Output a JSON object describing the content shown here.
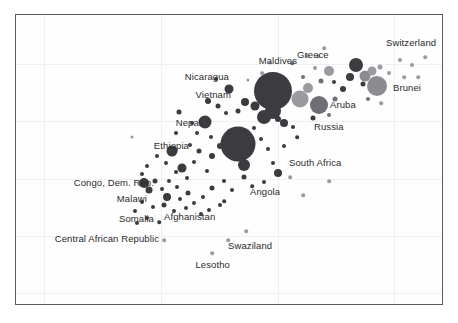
{
  "chart_data": {
    "type": "scatter",
    "title": "",
    "subtitle": "",
    "xlabel": "",
    "ylabel": "",
    "xlim": [
      0,
      428
    ],
    "ylim": [
      0,
      291
    ],
    "grid": true,
    "legend": "none",
    "note": "Bubble scatter of countries; bubble area encodes a third magnitude variable, shade encodes a fourth. Positions read in plot-pixel coordinates from the rendered figure.",
    "gridlines_x": [
      28,
      145,
      262,
      378
    ],
    "gridlines_y": [
      49,
      106,
      164,
      221,
      278
    ],
    "colors": {
      "bubble_dark": "#3c3c40",
      "bubble_mid": "#6e6e74",
      "bubble_light": "#9a9aa0",
      "bubble_grayish": "#8b8b90",
      "frame": "#5a5a60",
      "grid": "#f0f0f2",
      "label_text": "#2b2b2b",
      "background": "#ffffff"
    },
    "labels": [
      {
        "text": "Switzerland",
        "x": 370,
        "y": 28,
        "anchor": "left"
      },
      {
        "text": "Greece",
        "x": 281,
        "y": 40,
        "anchor": "left"
      },
      {
        "text": "Maldives",
        "x": 281,
        "y": 46,
        "anchor": "right"
      },
      {
        "text": "Brunei",
        "x": 377,
        "y": 73,
        "anchor": "left"
      },
      {
        "text": "Aruba",
        "x": 314,
        "y": 90,
        "anchor": "left"
      },
      {
        "text": "Nicaragua",
        "x": 213,
        "y": 62,
        "anchor": "right"
      },
      {
        "text": "Vietnam",
        "x": 215,
        "y": 80,
        "anchor": "right"
      },
      {
        "text": "Russia",
        "x": 298,
        "y": 112,
        "anchor": "left"
      },
      {
        "text": "Nepal",
        "x": 185,
        "y": 108,
        "anchor": "right"
      },
      {
        "text": "Ethiopia",
        "x": 173,
        "y": 131,
        "anchor": "right"
      },
      {
        "text": "South Africa",
        "x": 273,
        "y": 148,
        "anchor": "left"
      },
      {
        "text": "Congo, Dem. Rep.",
        "x": 138,
        "y": 168,
        "anchor": "right"
      },
      {
        "text": "Angola",
        "x": 234,
        "y": 177,
        "anchor": "left"
      },
      {
        "text": "Malawi",
        "x": 131,
        "y": 184,
        "anchor": "right"
      },
      {
        "text": "Afghanistan",
        "x": 148,
        "y": 202,
        "anchor": "left"
      },
      {
        "text": "Somalia",
        "x": 138,
        "y": 204,
        "anchor": "right"
      },
      {
        "text": "Central African Republic",
        "x": 143,
        "y": 224,
        "anchor": "right"
      },
      {
        "text": "Swaziland",
        "x": 212,
        "y": 231,
        "anchor": "left"
      },
      {
        "text": "Lesotho",
        "x": 214,
        "y": 250,
        "anchor": "right"
      }
    ],
    "bubbles": [
      {
        "x": 257,
        "y": 76,
        "r": 19.0,
        "shade": "dark"
      },
      {
        "x": 222,
        "y": 129,
        "r": 17.5,
        "shade": "dark"
      },
      {
        "x": 228,
        "y": 150,
        "r": 6.0,
        "shade": "dark"
      },
      {
        "x": 284,
        "y": 84,
        "r": 8.5,
        "shade": "light"
      },
      {
        "x": 292,
        "y": 73,
        "r": 5.0,
        "shade": "light"
      },
      {
        "x": 361,
        "y": 71,
        "r": 10.0,
        "shade": "grayish"
      },
      {
        "x": 340,
        "y": 50,
        "r": 7.0,
        "shade": "dark"
      },
      {
        "x": 349,
        "y": 61,
        "r": 5.5,
        "shade": "grayish"
      },
      {
        "x": 356,
        "y": 56,
        "r": 4.5,
        "shade": "light"
      },
      {
        "x": 334,
        "y": 62,
        "r": 4.0,
        "shade": "dark"
      },
      {
        "x": 327,
        "y": 74,
        "r": 3.0,
        "shade": "dark"
      },
      {
        "x": 318,
        "y": 67,
        "r": 2.0,
        "shade": "dark"
      },
      {
        "x": 347,
        "y": 69,
        "r": 2.5,
        "shade": "dark"
      },
      {
        "x": 364,
        "y": 52,
        "r": 2.5,
        "shade": "light"
      },
      {
        "x": 373,
        "y": 58,
        "r": 2.0,
        "shade": "light"
      },
      {
        "x": 313,
        "y": 56,
        "r": 5.0,
        "shade": "light"
      },
      {
        "x": 305,
        "y": 66,
        "r": 2.5,
        "shade": "mid"
      },
      {
        "x": 299,
        "y": 53,
        "r": 2.0,
        "shade": "light"
      },
      {
        "x": 291,
        "y": 41,
        "r": 2.0,
        "shade": "light"
      },
      {
        "x": 302,
        "y": 41,
        "r": 1.8,
        "shade": "light"
      },
      {
        "x": 308,
        "y": 33,
        "r": 1.8,
        "shade": "light"
      },
      {
        "x": 384,
        "y": 45,
        "r": 2.0,
        "shade": "light"
      },
      {
        "x": 396,
        "y": 50,
        "r": 2.0,
        "shade": "light"
      },
      {
        "x": 409,
        "y": 42,
        "r": 1.8,
        "shade": "light"
      },
      {
        "x": 388,
        "y": 62,
        "r": 1.8,
        "shade": "light"
      },
      {
        "x": 402,
        "y": 62,
        "r": 1.8,
        "shade": "light"
      },
      {
        "x": 352,
        "y": 84,
        "r": 2.0,
        "shade": "mid"
      },
      {
        "x": 365,
        "y": 88,
        "r": 1.8,
        "shade": "light"
      },
      {
        "x": 303,
        "y": 90,
        "r": 9.0,
        "shade": "mid"
      },
      {
        "x": 297,
        "y": 103,
        "r": 2.5,
        "shade": "dark"
      },
      {
        "x": 313,
        "y": 100,
        "r": 2.0,
        "shade": "mid"
      },
      {
        "x": 319,
        "y": 84,
        "r": 2.5,
        "shade": "mid"
      },
      {
        "x": 287,
        "y": 62,
        "r": 2.0,
        "shade": "mid"
      },
      {
        "x": 276,
        "y": 48,
        "r": 1.8,
        "shade": "mid"
      },
      {
        "x": 268,
        "y": 108,
        "r": 4.0,
        "shade": "dark"
      },
      {
        "x": 277,
        "y": 112,
        "r": 2.0,
        "shade": "dark"
      },
      {
        "x": 257,
        "y": 96,
        "r": 8.0,
        "shade": "dark"
      },
      {
        "x": 248,
        "y": 102,
        "r": 7.0,
        "shade": "dark"
      },
      {
        "x": 262,
        "y": 104,
        "r": 3.0,
        "shade": "dark"
      },
      {
        "x": 239,
        "y": 91,
        "r": 4.5,
        "shade": "dark"
      },
      {
        "x": 229,
        "y": 87,
        "r": 4.0,
        "shade": "dark"
      },
      {
        "x": 222,
        "y": 96,
        "r": 2.5,
        "shade": "dark"
      },
      {
        "x": 238,
        "y": 113,
        "r": 2.0,
        "shade": "dark"
      },
      {
        "x": 245,
        "y": 124,
        "r": 2.0,
        "shade": "dark"
      },
      {
        "x": 252,
        "y": 134,
        "r": 2.0,
        "shade": "dark"
      },
      {
        "x": 257,
        "y": 148,
        "r": 2.0,
        "shade": "dark"
      },
      {
        "x": 268,
        "y": 131,
        "r": 2.0,
        "shade": "dark"
      },
      {
        "x": 281,
        "y": 122,
        "r": 1.8,
        "shade": "dark"
      },
      {
        "x": 213,
        "y": 74,
        "r": 4.5,
        "shade": "dark"
      },
      {
        "x": 200,
        "y": 64,
        "r": 2.0,
        "shade": "dark"
      },
      {
        "x": 192,
        "y": 86,
        "r": 3.0,
        "shade": "dark"
      },
      {
        "x": 202,
        "y": 91,
        "r": 2.5,
        "shade": "dark"
      },
      {
        "x": 210,
        "y": 98,
        "r": 2.0,
        "shade": "dark"
      },
      {
        "x": 189,
        "y": 107,
        "r": 6.5,
        "shade": "dark"
      },
      {
        "x": 176,
        "y": 108,
        "r": 2.0,
        "shade": "dark"
      },
      {
        "x": 163,
        "y": 97,
        "r": 2.5,
        "shade": "dark"
      },
      {
        "x": 181,
        "y": 118,
        "r": 2.0,
        "shade": "dark"
      },
      {
        "x": 195,
        "y": 122,
        "r": 2.0,
        "shade": "dark"
      },
      {
        "x": 204,
        "y": 131,
        "r": 3.0,
        "shade": "dark"
      },
      {
        "x": 196,
        "y": 141,
        "r": 3.0,
        "shade": "dark"
      },
      {
        "x": 183,
        "y": 136,
        "r": 2.5,
        "shade": "dark"
      },
      {
        "x": 174,
        "y": 130,
        "r": 2.0,
        "shade": "dark"
      },
      {
        "x": 160,
        "y": 118,
        "r": 2.0,
        "shade": "dark"
      },
      {
        "x": 156,
        "y": 136,
        "r": 5.5,
        "shade": "dark"
      },
      {
        "x": 166,
        "y": 153,
        "r": 4.5,
        "shade": "dark"
      },
      {
        "x": 178,
        "y": 147,
        "r": 2.0,
        "shade": "dark"
      },
      {
        "x": 191,
        "y": 156,
        "r": 2.0,
        "shade": "dark"
      },
      {
        "x": 171,
        "y": 163,
        "r": 2.0,
        "shade": "dark"
      },
      {
        "x": 160,
        "y": 157,
        "r": 2.0,
        "shade": "dark"
      },
      {
        "x": 150,
        "y": 148,
        "r": 2.0,
        "shade": "dark"
      },
      {
        "x": 141,
        "y": 141,
        "r": 2.0,
        "shade": "dark"
      },
      {
        "x": 131,
        "y": 151,
        "r": 2.0,
        "shade": "dark"
      },
      {
        "x": 126,
        "y": 159,
        "r": 2.0,
        "shade": "dark"
      },
      {
        "x": 139,
        "y": 166,
        "r": 2.5,
        "shade": "dark"
      },
      {
        "x": 128,
        "y": 168,
        "r": 5.0,
        "shade": "dark"
      },
      {
        "x": 133,
        "y": 175,
        "r": 3.5,
        "shade": "dark"
      },
      {
        "x": 146,
        "y": 174,
        "r": 2.0,
        "shade": "dark"
      },
      {
        "x": 153,
        "y": 166,
        "r": 2.0,
        "shade": "dark"
      },
      {
        "x": 161,
        "y": 172,
        "r": 2.0,
        "shade": "dark"
      },
      {
        "x": 151,
        "y": 182,
        "r": 4.0,
        "shade": "dark"
      },
      {
        "x": 164,
        "y": 184,
        "r": 2.0,
        "shade": "dark"
      },
      {
        "x": 172,
        "y": 178,
        "r": 2.5,
        "shade": "dark"
      },
      {
        "x": 178,
        "y": 188,
        "r": 2.0,
        "shade": "dark"
      },
      {
        "x": 187,
        "y": 182,
        "r": 2.0,
        "shade": "dark"
      },
      {
        "x": 196,
        "y": 173,
        "r": 2.5,
        "shade": "dark"
      },
      {
        "x": 208,
        "y": 166,
        "r": 2.0,
        "shade": "dark"
      },
      {
        "x": 216,
        "y": 175,
        "r": 2.0,
        "shade": "dark"
      },
      {
        "x": 204,
        "y": 190,
        "r": 2.0,
        "shade": "dark"
      },
      {
        "x": 193,
        "y": 195,
        "r": 2.0,
        "shade": "dark"
      },
      {
        "x": 185,
        "y": 199,
        "r": 2.0,
        "shade": "dark"
      },
      {
        "x": 170,
        "y": 193,
        "r": 2.0,
        "shade": "dark"
      },
      {
        "x": 158,
        "y": 196,
        "r": 2.0,
        "shade": "dark"
      },
      {
        "x": 148,
        "y": 190,
        "r": 2.5,
        "shade": "dark"
      },
      {
        "x": 137,
        "y": 192,
        "r": 2.0,
        "shade": "dark"
      },
      {
        "x": 126,
        "y": 187,
        "r": 2.0,
        "shade": "dark"
      },
      {
        "x": 119,
        "y": 196,
        "r": 2.0,
        "shade": "dark"
      },
      {
        "x": 121,
        "y": 208,
        "r": 2.0,
        "shade": "dark"
      },
      {
        "x": 131,
        "y": 203,
        "r": 2.0,
        "shade": "dark"
      },
      {
        "x": 143,
        "y": 207,
        "r": 1.8,
        "shade": "dark"
      },
      {
        "x": 208,
        "y": 186,
        "r": 1.8,
        "shade": "dark"
      },
      {
        "x": 228,
        "y": 162,
        "r": 2.5,
        "shade": "dark"
      },
      {
        "x": 236,
        "y": 171,
        "r": 1.8,
        "shade": "dark"
      },
      {
        "x": 248,
        "y": 167,
        "r": 2.0,
        "shade": "dark"
      },
      {
        "x": 262,
        "y": 158,
        "r": 4.0,
        "shade": "dark"
      },
      {
        "x": 274,
        "y": 162,
        "r": 1.8,
        "shade": "light"
      },
      {
        "x": 287,
        "y": 180,
        "r": 1.8,
        "shade": "light"
      },
      {
        "x": 313,
        "y": 166,
        "r": 1.8,
        "shade": "light"
      },
      {
        "x": 212,
        "y": 225,
        "r": 1.8,
        "shade": "light"
      },
      {
        "x": 196,
        "y": 238,
        "r": 1.8,
        "shade": "light"
      },
      {
        "x": 148,
        "y": 225,
        "r": 1.8,
        "shade": "light"
      },
      {
        "x": 230,
        "y": 216,
        "r": 1.8,
        "shade": "light"
      },
      {
        "x": 116,
        "y": 122,
        "r": 1.6,
        "shade": "light"
      },
      {
        "x": 246,
        "y": 58,
        "r": 1.8,
        "shade": "light"
      },
      {
        "x": 254,
        "y": 48,
        "r": 1.6,
        "shade": "light"
      },
      {
        "x": 232,
        "y": 65,
        "r": 1.6,
        "shade": "light"
      }
    ]
  }
}
